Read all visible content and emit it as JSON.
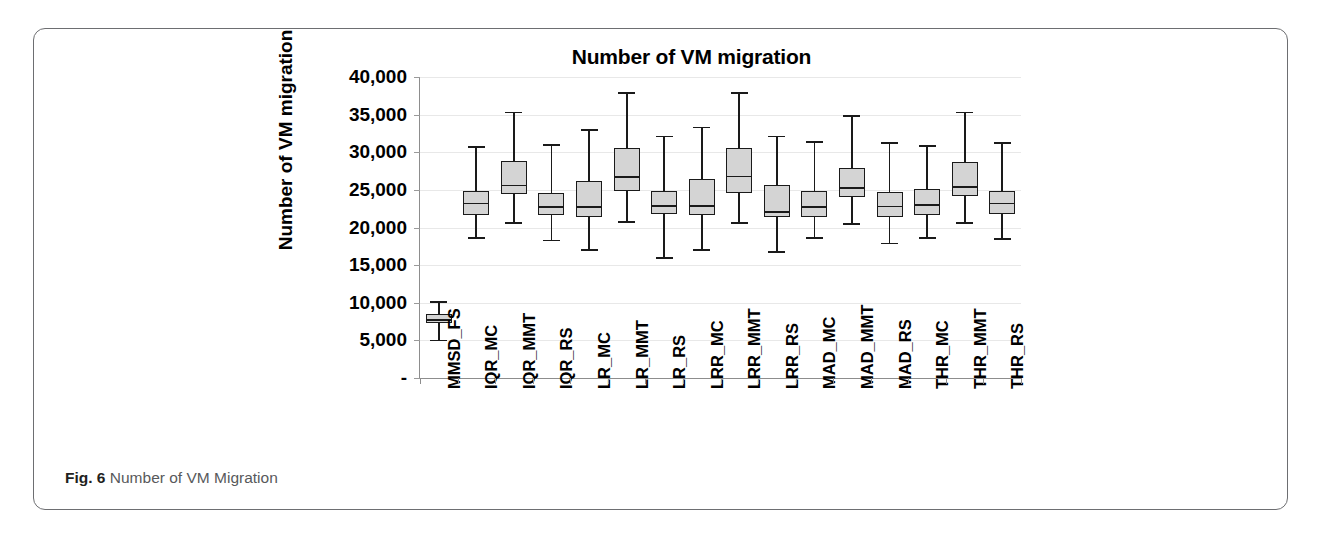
{
  "figure": {
    "caption_label": "Fig. 6",
    "caption_text": "Number of VM Migration"
  },
  "chart_data": {
    "type": "box",
    "title": "Number of VM migration",
    "xlabel": "",
    "ylabel": "Number of VM migration",
    "ylim": [
      0,
      40000
    ],
    "y_ticks": [
      0,
      5000,
      10000,
      15000,
      20000,
      25000,
      30000,
      35000,
      40000
    ],
    "y_tick_labels": [
      "-",
      "5,000",
      "10,000",
      "15,000",
      "20,000",
      "25,000",
      "30,000",
      "35,000",
      "40,000"
    ],
    "grid": true,
    "legend": "none",
    "box_fill_color": "#d4d4d4",
    "box_line_color": "#1a1a1a",
    "categories": [
      "MMSD_FS",
      "IQR_MC",
      "IQR_MMT",
      "IQR_RS",
      "LR_MC",
      "LR_MMT",
      "LR_RS",
      "LRR_MC",
      "LRR_MMT",
      "LRR_RS",
      "MAD_MC",
      "MAD_MMT",
      "MAD_RS",
      "THR_MC",
      "THR_MMT",
      "THR_RS"
    ],
    "boxes": [
      {
        "category": "MMSD_FS",
        "min": 5100,
        "q1": 7300,
        "median": 7800,
        "q3": 8500,
        "max": 10200
      },
      {
        "category": "IQR_MC",
        "min": 18700,
        "q1": 21700,
        "median": 23300,
        "q3": 24800,
        "max": 30800
      },
      {
        "category": "IQR_MMT",
        "min": 20700,
        "q1": 24400,
        "median": 25700,
        "q3": 28800,
        "max": 35400
      },
      {
        "category": "IQR_RS",
        "min": 18400,
        "q1": 21600,
        "median": 22800,
        "q3": 24600,
        "max": 31100
      },
      {
        "category": "LR_MC",
        "min": 17100,
        "q1": 21400,
        "median": 22800,
        "q3": 26200,
        "max": 33100
      },
      {
        "category": "LR_MMT",
        "min": 20800,
        "q1": 24800,
        "median": 26800,
        "q3": 30600,
        "max": 38000
      },
      {
        "category": "LR_RS",
        "min": 16100,
        "q1": 21800,
        "median": 23000,
        "q3": 24900,
        "max": 32200
      },
      {
        "category": "LRR_MC",
        "min": 17100,
        "q1": 21600,
        "median": 23000,
        "q3": 26400,
        "max": 33400
      },
      {
        "category": "LRR_MMT",
        "min": 20700,
        "q1": 24600,
        "median": 26900,
        "q3": 30500,
        "max": 38000
      },
      {
        "category": "LRR_RS",
        "min": 16900,
        "q1": 21400,
        "median": 22200,
        "q3": 25700,
        "max": 32200
      },
      {
        "category": "MAD_MC",
        "min": 18700,
        "q1": 21400,
        "median": 22800,
        "q3": 24800,
        "max": 31500
      },
      {
        "category": "MAD_MMT",
        "min": 20600,
        "q1": 24000,
        "median": 25400,
        "q3": 27900,
        "max": 34900
      },
      {
        "category": "MAD_RS",
        "min": 18000,
        "q1": 21400,
        "median": 22900,
        "q3": 24700,
        "max": 31400
      },
      {
        "category": "THR_MC",
        "min": 18700,
        "q1": 21700,
        "median": 23100,
        "q3": 25100,
        "max": 31000
      },
      {
        "category": "THR_MMT",
        "min": 20700,
        "q1": 24200,
        "median": 25500,
        "q3": 28700,
        "max": 35400
      },
      {
        "category": "THR_RS",
        "min": 18600,
        "q1": 21800,
        "median": 23300,
        "q3": 24900,
        "max": 31400
      }
    ]
  }
}
